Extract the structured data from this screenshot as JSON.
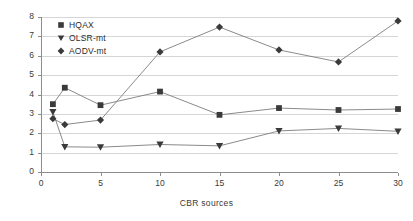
{
  "chart_data": {
    "type": "line",
    "title": "",
    "xlabel": "CBR sources",
    "ylabel": "Delay(ms)",
    "xlim": [
      0,
      30
    ],
    "ylim": [
      0,
      8
    ],
    "xticks": [
      "0",
      "5",
      "10",
      "15",
      "20",
      "25",
      "30"
    ],
    "yticks": [
      "0",
      "1",
      "2",
      "3",
      "4",
      "5",
      "6",
      "7",
      "8"
    ],
    "grid": true,
    "legend_position": "top-left",
    "x": [
      1,
      2,
      5,
      10,
      15,
      20,
      25,
      30
    ],
    "series": [
      {
        "name": "HQAX",
        "marker": "square",
        "color": "#3a3a3a",
        "values": [
          3.5,
          4.35,
          3.45,
          4.15,
          2.95,
          3.3,
          3.2,
          3.25
        ]
      },
      {
        "name": "OLSR-mt",
        "marker": "triangle-down",
        "color": "#3a3a3a",
        "values": [
          3.1,
          1.3,
          1.28,
          1.42,
          1.35,
          2.12,
          2.25,
          2.1
        ]
      },
      {
        "name": "AODV-mt",
        "marker": "diamond",
        "color": "#3a3a3a",
        "values": [
          2.75,
          2.45,
          2.68,
          6.2,
          7.48,
          6.3,
          5.68,
          7.8
        ]
      }
    ]
  },
  "legend": {
    "items": [
      {
        "label": "HQAX"
      },
      {
        "label": "OLSR-mt"
      },
      {
        "label": "AODV-mt"
      }
    ]
  }
}
